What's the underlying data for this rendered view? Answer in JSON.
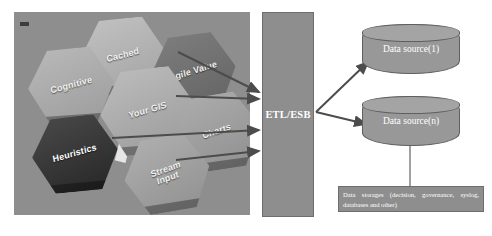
{
  "diagram": {
    "colors": {
      "panel_background": "#8e8e8e",
      "box_fill": "#8e8e8e",
      "box_border": "#6e6e6e",
      "cylinder_fill": "#989898",
      "arrow": "#4c4c4c",
      "label_text": "#ffffff",
      "page_background": "#ffffff"
    }
  },
  "sources_panel": {
    "name": "hexagon-tiles-photo",
    "tiles": [
      {
        "id": "cognitive",
        "label": "Cognitive",
        "tone": "light"
      },
      {
        "id": "cached",
        "label": "Cached",
        "tone": "light"
      },
      {
        "id": "agile",
        "label": "Agile Value",
        "tone": "dark"
      },
      {
        "id": "yourgis",
        "label": "Your GIS",
        "tone": "light"
      },
      {
        "id": "charts",
        "label": "Charts",
        "tone": "mid"
      },
      {
        "id": "heuristics",
        "label": "Heuristics",
        "tone": "darkest"
      },
      {
        "id": "stream",
        "label": "Stream\nInput",
        "tone": "mid"
      }
    ]
  },
  "etl": {
    "label": "ETL/ESB"
  },
  "storages": [
    {
      "id": "source-1",
      "label": "Data source(1)"
    },
    {
      "id": "source-n",
      "label": "Data source(n)"
    }
  ],
  "caption": {
    "text": "Data storages (decision, governance, syslog, databases and other)"
  },
  "arrows": {
    "inbound_count": 4,
    "outbound_count": 2,
    "connector_label": ""
  }
}
